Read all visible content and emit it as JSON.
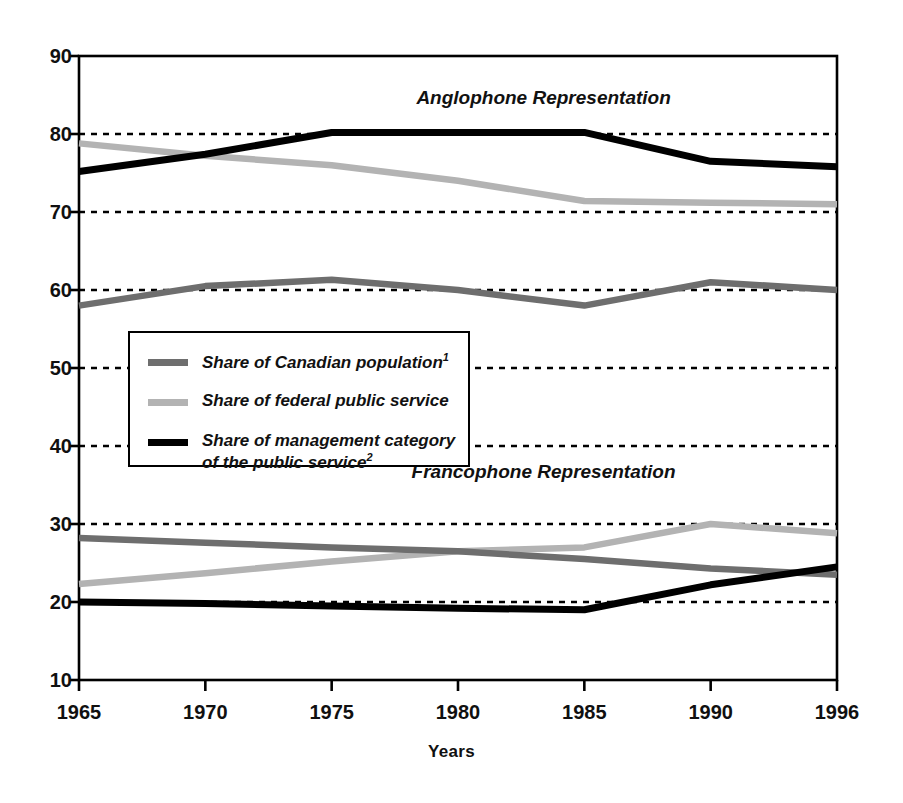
{
  "chart_data": {
    "type": "line",
    "title": "",
    "xlabel": "Years",
    "ylabel": "",
    "x": [
      1965,
      1970,
      1975,
      1980,
      1985,
      1990,
      1996
    ],
    "x_tick_labels": [
      "1965",
      "1970",
      "1975",
      "1980",
      "1985",
      "1990",
      "1996"
    ],
    "y_tick_labels": [
      "10",
      "20",
      "30",
      "40",
      "50",
      "60",
      "70",
      "80",
      "90"
    ],
    "y_ticks": [
      10,
      20,
      30,
      40,
      50,
      60,
      70,
      80,
      90
    ],
    "ylim": [
      10,
      90
    ],
    "xlim": [
      1965,
      1996
    ],
    "grid": "horizontal-dashed",
    "legend_position": "inner-left-middle",
    "annotations": [
      {
        "text": "Anglophone Representation",
        "x": 1984,
        "y": 84.5
      },
      {
        "text": "Francophone Representation",
        "x": 1984,
        "y": 36.5
      }
    ],
    "series": [
      {
        "name": "Share of Canadian population¹",
        "group": "Anglophone",
        "color": "#6e6e6e",
        "values": [
          58.0,
          60.5,
          61.3,
          60.0,
          58.0,
          61.0,
          60.0
        ]
      },
      {
        "name": "Share of federal public service",
        "group": "Anglophone",
        "color": "#b3b3b3",
        "values": [
          78.8,
          77.2,
          76.0,
          74.0,
          71.4,
          71.2,
          71.0
        ]
      },
      {
        "name": "Share of management category of the public service²",
        "group": "Anglophone",
        "color": "#000000",
        "values": [
          75.2,
          77.4,
          80.2,
          80.2,
          80.2,
          76.5,
          75.8
        ]
      },
      {
        "name": "Share of Canadian population¹",
        "group": "Francophone",
        "color": "#6e6e6e",
        "values": [
          28.2,
          27.6,
          27.0,
          26.5,
          25.5,
          24.3,
          23.5
        ]
      },
      {
        "name": "Share of federal public service",
        "group": "Francophone",
        "color": "#b3b3b3",
        "values": [
          22.3,
          23.7,
          25.2,
          26.5,
          27.0,
          30.0,
          28.8
        ]
      },
      {
        "name": "Share of management category of the public service²",
        "group": "Francophone",
        "color": "#000000",
        "values": [
          20.0,
          19.8,
          19.5,
          19.2,
          19.0,
          22.2,
          24.5
        ]
      }
    ]
  },
  "axis": {
    "x_title": "Years"
  },
  "legend": {
    "items": [
      {
        "label": "Share of Canadian population",
        "footnote": "1",
        "color": "#6e6e6e",
        "swatch_name": "legend-swatch-population"
      },
      {
        "label": "Share of federal public service",
        "footnote": "",
        "color": "#b3b3b3",
        "swatch_name": "legend-swatch-public-service"
      },
      {
        "label": "Share of management category\nof the public service",
        "footnote": "2",
        "color": "#000000",
        "swatch_name": "legend-swatch-management"
      }
    ]
  },
  "regions": {
    "anglophone": "Anglophone Representation",
    "francophone": "Francophone Representation"
  },
  "colors": {
    "population": "#6e6e6e",
    "public_service": "#b3b3b3",
    "management": "#000000",
    "axis": "#000000",
    "grid": "#000000",
    "background": "#ffffff"
  }
}
